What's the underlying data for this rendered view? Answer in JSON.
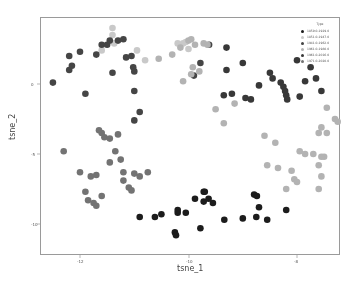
{
  "chart_data": {
    "type": "scatter",
    "title": "",
    "xlabel": "tsne_1",
    "ylabel": "tsne_2",
    "xlim": [
      -12.75,
      -7.25
    ],
    "ylim": [
      -11.2,
      4.6
    ],
    "xticks": [
      {
        "value": -12,
        "label": "-12",
        "px": 80
      },
      {
        "value": -10,
        "label": "-10",
        "px": 189
      },
      {
        "value": -8,
        "label": "-8",
        "px": 297
      }
    ],
    "yticks": [
      {
        "value": 0,
        "label": "0",
        "px": 84
      },
      {
        "value": -5,
        "label": "-5",
        "px": 154
      },
      {
        "value": -10,
        "label": "-10",
        "px": 224
      }
    ],
    "grid": false,
    "legend": {
      "title": "Type",
      "position": "upper right",
      "entries": [
        {
          "label": "1859.0-1929.0",
          "color": "#1c1c1c"
        },
        {
          "label": "1851.0-1947.0",
          "color": "#c9c9c9"
        },
        {
          "label": "1941.0-1962.0",
          "color": "#454545"
        },
        {
          "label": "1961.0-1980.0",
          "color": "#b3b3b3"
        },
        {
          "label": "1961.0-2016.0",
          "color": "#383838"
        },
        {
          "label": "1971.0-2020.0",
          "color": "#737373"
        }
      ]
    },
    "series": [
      {
        "name": "1859.0-1929.0",
        "color": "#1c1c1c",
        "points": [
          [
            -10.9,
            -9.5
          ],
          [
            -10.62,
            -9.5
          ],
          [
            -10.5,
            -9.3
          ],
          [
            -10.25,
            -10.6
          ],
          [
            -10.23,
            -10.8
          ],
          [
            -10.2,
            -9.2
          ],
          [
            -10.2,
            -9.0
          ],
          [
            -9.88,
            -8.2
          ],
          [
            -9.72,
            -7.7
          ],
          [
            -9.72,
            -8.4
          ],
          [
            -9.55,
            -8.5
          ],
          [
            -9.63,
            -8.2
          ],
          [
            -9.7,
            -7.7
          ],
          [
            -9.78,
            -10.3
          ],
          [
            -9.34,
            -9.7
          ],
          [
            -8.79,
            -7.9
          ],
          [
            -8.74,
            -8.0
          ],
          [
            -8.7,
            -8.8
          ],
          [
            -8.75,
            -9.5
          ],
          [
            -8.55,
            -9.7
          ],
          [
            -8.2,
            -9.0
          ],
          [
            -10.05,
            -9.2
          ],
          [
            -9.0,
            -9.6
          ]
        ]
      },
      {
        "name": "1851.0-1947.0",
        "color": "#c9c9c9",
        "points": [
          [
            -11.4,
            4.0
          ],
          [
            -11.4,
            3.5
          ],
          [
            -11.37,
            2.9
          ],
          [
            -11.6,
            2.4
          ],
          [
            -10.95,
            2.4
          ],
          [
            -10.8,
            1.7
          ],
          [
            -10.2,
            2.9
          ],
          [
            -10.1,
            2.9
          ],
          [
            -10.05,
            3.0
          ],
          [
            -10.0,
            2.5
          ]
        ]
      },
      {
        "name": "1941.0-1962.0",
        "color": "#454545",
        "points": [
          [
            -12.5,
            0.1
          ],
          [
            -12.2,
            1.0
          ],
          [
            -12.2,
            2.0
          ],
          [
            -12.0,
            2.3
          ],
          [
            -12.15,
            1.3
          ],
          [
            -11.9,
            -0.7
          ],
          [
            -11.7,
            2.1
          ],
          [
            -11.6,
            2.8
          ],
          [
            -11.5,
            2.8
          ],
          [
            -11.45,
            3.1
          ],
          [
            -11.3,
            3.1
          ],
          [
            -11.2,
            3.2
          ],
          [
            -11.15,
            1.9
          ],
          [
            -11.05,
            2.0
          ],
          [
            -11.02,
            1.2
          ],
          [
            -11.0,
            0.9
          ],
          [
            -11.0,
            -0.5
          ],
          [
            -10.9,
            -2.0
          ],
          [
            -11.0,
            -2.6
          ],
          [
            -11.4,
            0.8
          ],
          [
            -9.62,
            2.8
          ],
          [
            -9.78,
            1.5
          ],
          [
            -9.9,
            0.6
          ]
        ]
      },
      {
        "name": "1961.0-1980.0",
        "color": "#b3b3b3",
        "points": [
          [
            -10.55,
            1.8
          ],
          [
            -10.3,
            2.1
          ],
          [
            -10.15,
            2.6
          ],
          [
            -10.0,
            3.1
          ],
          [
            -9.95,
            3.2
          ],
          [
            -9.88,
            2.8
          ],
          [
            -9.72,
            2.9
          ],
          [
            -9.65,
            2.8
          ],
          [
            -9.8,
            0.9
          ],
          [
            -9.95,
            0.7
          ],
          [
            -10.1,
            0.2
          ],
          [
            -9.92,
            1.2
          ],
          [
            -9.5,
            -1.8
          ],
          [
            -9.35,
            -2.8
          ],
          [
            -9.15,
            -1.4
          ],
          [
            -8.6,
            -3.7
          ],
          [
            -8.4,
            -4.2
          ],
          [
            -8.55,
            -5.8
          ],
          [
            -8.35,
            -6.0
          ],
          [
            -8.1,
            -6.2
          ],
          [
            -8.05,
            -6.8
          ],
          [
            -8.0,
            -7.0
          ],
          [
            -8.2,
            -7.5
          ],
          [
            -7.95,
            -4.8
          ],
          [
            -7.85,
            -5.0
          ],
          [
            -7.6,
            -3.5
          ],
          [
            -7.45,
            -3.5
          ],
          [
            -7.5,
            -5.2
          ],
          [
            -7.6,
            -5.8
          ],
          [
            -7.55,
            -5.2
          ],
          [
            -7.55,
            -6.6
          ],
          [
            -7.6,
            -7.5
          ],
          [
            -7.3,
            -2.5
          ],
          [
            -7.25,
            -2.7
          ],
          [
            -7.7,
            -5.0
          ],
          [
            -7.45,
            -1.7
          ],
          [
            -7.55,
            -3.1
          ]
        ]
      },
      {
        "name": "1961.0-2016.0",
        "color": "#383838",
        "points": [
          [
            -9.3,
            2.6
          ],
          [
            -9.3,
            1.0
          ],
          [
            -9.0,
            1.5
          ],
          [
            -8.95,
            -1.0
          ],
          [
            -8.85,
            -1.1
          ],
          [
            -8.7,
            -0.1
          ],
          [
            -8.5,
            0.8
          ],
          [
            -8.45,
            0.4
          ],
          [
            -8.3,
            0.1
          ],
          [
            -8.25,
            -0.2
          ],
          [
            -8.22,
            -0.5
          ],
          [
            -8.2,
            -0.8
          ],
          [
            -8.18,
            -1.1
          ],
          [
            -8.0,
            1.7
          ],
          [
            -7.95,
            -0.9
          ],
          [
            -7.85,
            0.2
          ],
          [
            -7.75,
            1.2
          ],
          [
            -7.65,
            0.4
          ],
          [
            -7.55,
            -0.5
          ],
          [
            -9.2,
            -0.7
          ],
          [
            -9.35,
            -0.8
          ]
        ]
      },
      {
        "name": "1971.0-2020.0",
        "color": "#737373",
        "points": [
          [
            -12.3,
            -4.8
          ],
          [
            -12.0,
            -6.3
          ],
          [
            -11.8,
            -6.6
          ],
          [
            -11.9,
            -7.7
          ],
          [
            -11.85,
            -8.3
          ],
          [
            -11.75,
            -8.5
          ],
          [
            -11.7,
            -8.7
          ],
          [
            -11.6,
            -8.0
          ],
          [
            -11.7,
            -6.5
          ],
          [
            -11.45,
            -5.6
          ],
          [
            -11.35,
            -4.8
          ],
          [
            -11.25,
            -5.4
          ],
          [
            -11.2,
            -6.9
          ],
          [
            -11.1,
            -7.4
          ],
          [
            -11.2,
            -6.3
          ],
          [
            -11.05,
            -7.6
          ],
          [
            -11.0,
            -6.4
          ],
          [
            -10.9,
            -6.6
          ],
          [
            -10.75,
            -6.3
          ],
          [
            -11.55,
            -3.8
          ],
          [
            -11.45,
            -3.9
          ],
          [
            -11.3,
            -3.6
          ],
          [
            -11.65,
            -3.3
          ],
          [
            -11.6,
            -3.5
          ]
        ]
      }
    ]
  }
}
